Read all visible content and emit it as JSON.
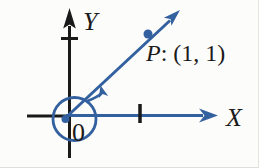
{
  "colors": {
    "blue": "#33609e",
    "black": "#1a1a1a",
    "background": "#fcfcfb"
  },
  "labels": {
    "y_axis": "Y",
    "x_axis": "X",
    "origin": "0",
    "point_name": "P",
    "point_coords": ": (1, 1)"
  }
}
